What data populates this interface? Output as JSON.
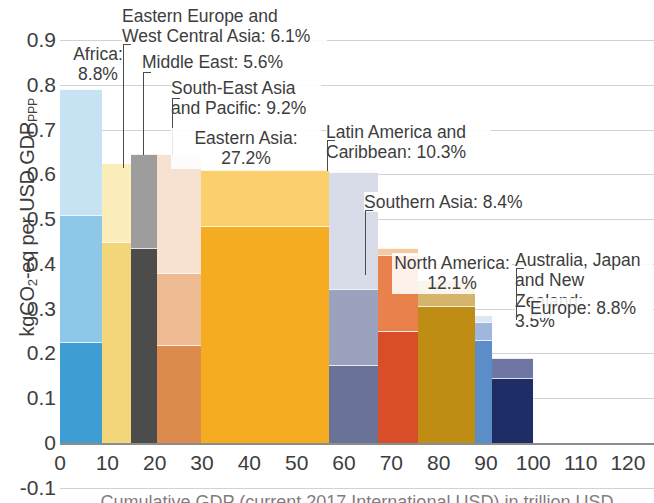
{
  "axes": {
    "ylabel_prefix": "kgCO",
    "ylabel_sub": "2",
    "ylabel_mid": "-eq per USD GDP",
    "ylabel_sup": "PPP",
    "ylabel_full": "kgCO2-eq per USD GDPPPP",
    "xtitle": "Cumulative GDP  (current 2017 International USD) in trillion USD",
    "yticks": [
      "0.9",
      "0.8",
      "0.7",
      "0.6",
      "0.5",
      "0.4",
      "0.3",
      "0.2",
      "0.1",
      "0",
      "-0.1"
    ],
    "xticks": [
      "0",
      "10",
      "20",
      "30",
      "40",
      "50",
      "60",
      "70",
      "80",
      "90",
      "100",
      "110",
      "120"
    ]
  },
  "chart_data": {
    "type": "bar",
    "subtype": "marimekko-stacked",
    "title": "",
    "xlabel": "Cumulative GDP  (current 2017 International USD) in trillion USD",
    "ylabel": "kgCO2-eq per USD GDP_PPP",
    "xlim": [
      0,
      125.5
    ],
    "ylim": [
      -0.1,
      0.93
    ],
    "grid": true,
    "legend": "none",
    "series_note": "Each bar width = share of global GDP (%); bar height = GHG intensity. Each bar is split into 3 stacked intensity segments.",
    "regions": [
      {
        "name": "Africa",
        "label": "Africa:\n8.8%",
        "gdp_share_pct": 8.8,
        "x_start": 0.0,
        "x_end": 8.8,
        "total_height": 0.79,
        "segments": [
          0.225,
          0.285,
          0.28
        ],
        "colors": [
          "#3e9ed4",
          "#8ec7e8",
          "#c6e3f4"
        ]
      },
      {
        "name": "Eastern Europe and West Central Asia",
        "label": "Eastern Europe and\nWest Central Asia: 6.1%",
        "gdp_share_pct": 6.1,
        "x_start": 8.8,
        "x_end": 14.9,
        "total_height": 0.625,
        "segments": [
          0.45,
          0.175,
          0.0
        ],
        "colors": [
          "#f2d679",
          "#fbeeba",
          "#fdf6dd"
        ]
      },
      {
        "name": "Middle East",
        "label": "Middle East: 5.6%",
        "gdp_share_pct": 5.6,
        "x_start": 14.9,
        "x_end": 20.5,
        "total_height": 0.645,
        "segments": [
          0.435,
          0.21,
          0.0
        ],
        "colors": [
          "#4c4c4c",
          "#9d9d9d",
          "#c9c9c9"
        ]
      },
      {
        "name": "South-East Asia and Pacific",
        "label": "South-East Asia\nand Pacific: 9.2%",
        "gdp_share_pct": 9.2,
        "x_start": 20.5,
        "x_end": 29.7,
        "total_height": 0.645,
        "segments": [
          0.22,
          0.16,
          0.265
        ],
        "colors": [
          "#dd8a4d",
          "#eebb93",
          "#f7e2d2"
        ]
      },
      {
        "name": "Eastern Asia",
        "label": "Eastern Asia:\n27.2%",
        "gdp_share_pct": 27.2,
        "x_start": 29.7,
        "x_end": 56.9,
        "total_height": 0.61,
        "segments": [
          0.485,
          0.125,
          0.0
        ],
        "colors": [
          "#f5ac20",
          "#fbcf6c",
          "#fde3a8"
        ]
      },
      {
        "name": "Latin America and Caribbean",
        "label": "Latin America and\nCaribbean: 10.3%",
        "gdp_share_pct": 10.3,
        "x_start": 56.9,
        "x_end": 67.2,
        "total_height": 0.605,
        "segments": [
          0.175,
          0.17,
          0.26
        ],
        "colors": [
          "#6a7298",
          "#9ba2bd",
          "#d8dce8"
        ]
      },
      {
        "name": "Southern Asia",
        "label": "Southern Asia: 8.4%",
        "gdp_share_pct": 8.4,
        "x_start": 67.2,
        "x_end": 75.6,
        "total_height": 0.435,
        "segments": [
          0.25,
          0.17,
          0.015
        ],
        "colors": [
          "#d94e28",
          "#e9814d",
          "#f7c9a0"
        ]
      },
      {
        "name": "North America",
        "label": "North America:\n12.1%",
        "gdp_share_pct": 12.1,
        "x_start": 75.6,
        "x_end": 87.7,
        "total_height": 0.365,
        "segments": [
          0.305,
          0.06,
          0.0
        ],
        "colors": [
          "#bf8c14",
          "#d4b56b",
          "#e3cd9a"
        ]
      },
      {
        "name": "Australia, Japan and New Zealand",
        "label": "Australia, Japan\nand New Zealand:\n3.5%",
        "gdp_share_pct": 3.5,
        "x_start": 87.7,
        "x_end": 91.2,
        "total_height": 0.285,
        "segments": [
          0.23,
          0.04,
          0.015
        ],
        "colors": [
          "#5b8dc8",
          "#9fb6dd",
          "#dde6f3"
        ]
      },
      {
        "name": "Europe",
        "label": "Europe: 8.8%",
        "gdp_share_pct": 8.8,
        "x_start": 91.2,
        "x_end": 100.0,
        "total_height": 0.19,
        "segments": [
          0.145,
          0.045,
          0.0
        ],
        "colors": [
          "#1f2d66",
          "#6e77a3",
          "#b9becf"
        ]
      }
    ]
  },
  "annotations": [
    {
      "key": "africa",
      "text": "Africa:\n8.8%"
    },
    {
      "key": "eastern-europe",
      "text": "Eastern Europe and\nWest Central Asia: 6.1%"
    },
    {
      "key": "middle-east",
      "text": "Middle East: 5.6%"
    },
    {
      "key": "south-east-asia",
      "text": "South-East Asia\nand Pacific: 9.2%"
    },
    {
      "key": "eastern-asia",
      "text": "Eastern Asia:\n27.2%"
    },
    {
      "key": "latin-america",
      "text": "Latin America and\nCaribbean: 10.3%"
    },
    {
      "key": "southern-asia",
      "text": "Southern Asia: 8.4%"
    },
    {
      "key": "north-america",
      "text": "North America:\n12.1%"
    },
    {
      "key": "australia-japan-nz",
      "text": "Australia, Japan\nand New Zealand:\n3.5%"
    },
    {
      "key": "europe",
      "text": "Europe: 8.8%"
    }
  ]
}
